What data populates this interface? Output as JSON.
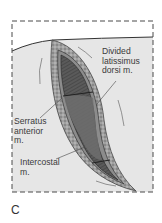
{
  "figure": {
    "panel_letter": "C",
    "labels": {
      "latissimus": "Divided\nlatissimus\ndorsi m.",
      "serratus": "Serratus\nanterior\nm.",
      "intercostal": "Intercostal\nm."
    },
    "colors": {
      "skin_area": "#e6e6e6",
      "border_dash": "#4a4a4a",
      "incision_edge": "#8a8a8a",
      "muscle_dark": "#4b4b4b",
      "muscle_mid": "#6e6e6e",
      "label_text": "#3a3a3a"
    }
  }
}
